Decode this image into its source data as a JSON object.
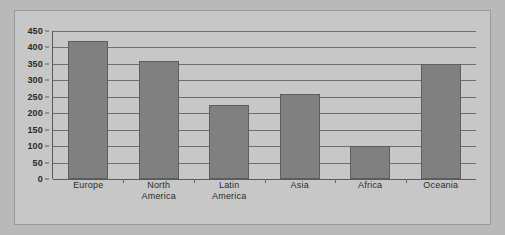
{
  "chart_data": {
    "type": "bar",
    "title": "",
    "subtitle": "",
    "xlabel": "",
    "ylabel": "",
    "categories": [
      "Europe",
      "North America",
      "Latin America",
      "Asia",
      "Africa",
      "Oceania"
    ],
    "category_lines": [
      [
        "Europe"
      ],
      [
        "North",
        "America"
      ],
      [
        "Latin",
        "America"
      ],
      [
        "Asia"
      ],
      [
        "Africa"
      ],
      [
        "Oceania"
      ]
    ],
    "values": [
      420,
      360,
      225,
      260,
      100,
      350
    ],
    "ylim": [
      0,
      450
    ],
    "ytick_step": 50,
    "yticks": [
      0,
      50,
      100,
      150,
      200,
      250,
      300,
      350,
      400,
      450
    ],
    "ytick_labels": [
      "0",
      "50",
      "100",
      "150",
      "200",
      "250",
      "300",
      "350",
      "400",
      "450"
    ],
    "grid": true,
    "grid_axis": "y",
    "legend": false,
    "legend_position": "none",
    "colors": {
      "bar_fill": "#808080",
      "bar_edge": "#5e5e5e",
      "plot_background": "#c7c7c7",
      "page_background": "#b9b9b9",
      "gridline": "#6e6e6e",
      "axis": "#5a5a5a",
      "text": "#2b2b2b",
      "frame_border": "#9a9a9a"
    }
  }
}
